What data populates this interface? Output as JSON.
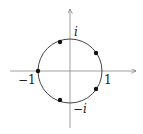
{
  "diagram": {
    "title": "",
    "labels": {
      "real_pos": "1",
      "real_neg": "−1",
      "imag_pos": "i",
      "imag_neg": "−i"
    },
    "points_degrees": [
      36,
      108,
      180,
      252,
      324
    ],
    "colors": {
      "stroke": "#444444",
      "point": "#111111"
    }
  }
}
